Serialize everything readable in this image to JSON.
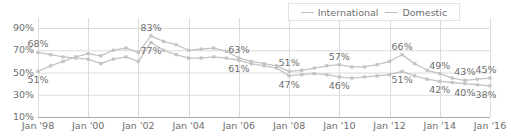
{
  "chart_data": {
    "type": "line",
    "title": "",
    "xlabel": "",
    "ylabel": "",
    "ylim": [
      10,
      90
    ],
    "ytick_values": [
      10,
      30,
      50,
      70,
      90
    ],
    "ytick_labels": [
      "10%",
      "30%",
      "50%",
      "70%",
      "90%"
    ],
    "xtick_labels": [
      "Jan '98",
      "Jan '00",
      "Jan '02",
      "Jan '04",
      "Jan '06",
      "Jan '08",
      "Jan '10",
      "Jan '12",
      "Jan '14",
      "Jan '16"
    ],
    "xtick_years": [
      1998,
      2000,
      2002,
      2004,
      2006,
      2008,
      2010,
      2012,
      2014,
      2016
    ],
    "grid": true,
    "legend_position": "top-right",
    "series": [
      {
        "name": "International",
        "color": "#c3c3c3",
        "x": [
          1998.0,
          1998.5,
          1999.0,
          1999.5,
          2000.0,
          2000.5,
          2001.0,
          2001.5,
          2002.0,
          2002.5,
          2003.0,
          2003.5,
          2004.0,
          2004.5,
          2005.0,
          2005.5,
          2006.0,
          2006.5,
          2007.0,
          2007.5,
          2008.0,
          2008.5,
          2009.0,
          2009.5,
          2010.0,
          2010.5,
          2011.0,
          2011.5,
          2012.0,
          2012.5,
          2013.0,
          2013.5,
          2014.0,
          2014.5,
          2015.0,
          2015.5,
          2016.0
        ],
        "values": [
          51,
          56,
          60,
          64,
          67,
          65,
          70,
          72,
          68,
          83,
          78,
          75,
          70,
          71,
          72,
          69,
          63,
          60,
          58,
          56,
          51,
          52,
          54,
          56,
          57,
          55,
          55,
          57,
          60,
          66,
          58,
          52,
          49,
          45,
          43,
          44,
          45
        ]
      },
      {
        "name": "Domestic",
        "color": "#c3c3c3",
        "x": [
          1998.0,
          1998.5,
          1999.0,
          1999.5,
          2000.0,
          2000.5,
          2001.0,
          2001.5,
          2002.0,
          2002.5,
          2003.0,
          2003.5,
          2004.0,
          2004.5,
          2005.0,
          2005.5,
          2006.0,
          2006.5,
          2007.0,
          2007.5,
          2008.0,
          2008.5,
          2009.0,
          2009.5,
          2010.0,
          2010.5,
          2011.0,
          2011.5,
          2012.0,
          2012.5,
          2013.0,
          2013.5,
          2014.0,
          2014.5,
          2015.0,
          2015.5,
          2016.0
        ],
        "values": [
          68,
          66,
          64,
          63,
          62,
          58,
          62,
          64,
          60,
          77,
          70,
          66,
          63,
          63,
          64,
          63,
          61,
          58,
          56,
          54,
          47,
          48,
          49,
          48,
          46,
          45,
          46,
          47,
          48,
          51,
          47,
          44,
          42,
          41,
          40,
          39,
          38
        ]
      }
    ],
    "annotations": [
      {
        "text": "68%",
        "x": 1998.0,
        "value": 68,
        "series": "Domestic",
        "pos": "above"
      },
      {
        "text": "51%",
        "x": 1998.0,
        "value": 51,
        "series": "International",
        "pos": "below"
      },
      {
        "text": "83%",
        "x": 2002.5,
        "value": 83,
        "series": "International",
        "pos": "above"
      },
      {
        "text": "77%",
        "x": 2002.5,
        "value": 77,
        "series": "Domestic",
        "pos": "below"
      },
      {
        "text": "63%",
        "x": 2006.0,
        "value": 63,
        "series": "International",
        "pos": "above"
      },
      {
        "text": "61%",
        "x": 2006.0,
        "value": 61,
        "series": "Domestic",
        "pos": "below"
      },
      {
        "text": "51%",
        "x": 2008.0,
        "value": 51,
        "series": "International",
        "pos": "above"
      },
      {
        "text": "47%",
        "x": 2008.0,
        "value": 47,
        "series": "Domestic",
        "pos": "below"
      },
      {
        "text": "57%",
        "x": 2010.0,
        "value": 57,
        "series": "International",
        "pos": "above"
      },
      {
        "text": "46%",
        "x": 2010.0,
        "value": 46,
        "series": "Domestic",
        "pos": "below"
      },
      {
        "text": "66%",
        "x": 2012.5,
        "value": 66,
        "series": "International",
        "pos": "above"
      },
      {
        "text": "51%",
        "x": 2012.5,
        "value": 51,
        "series": "Domestic",
        "pos": "below"
      },
      {
        "text": "49%",
        "x": 2014.0,
        "value": 49,
        "series": "International",
        "pos": "above"
      },
      {
        "text": "42%",
        "x": 2014.0,
        "value": 42,
        "series": "Domestic",
        "pos": "below"
      },
      {
        "text": "43%",
        "x": 2015.0,
        "value": 43,
        "series": "International",
        "pos": "above"
      },
      {
        "text": "40%",
        "x": 2015.0,
        "value": 40,
        "series": "Domestic",
        "pos": "below"
      },
      {
        "text": "45%",
        "x": 2016.0,
        "value": 45,
        "series": "International",
        "pos": "above"
      },
      {
        "text": "38%",
        "x": 2016.0,
        "value": 38,
        "series": "Domestic",
        "pos": "below"
      }
    ]
  },
  "legend": {
    "items": [
      {
        "label": "International"
      },
      {
        "label": "Domestic"
      }
    ]
  },
  "colors": {
    "line": "#c3c3c3",
    "grid": "#dcdcdc",
    "axis": "#a8a8a8",
    "text": "#6e6e6e"
  }
}
